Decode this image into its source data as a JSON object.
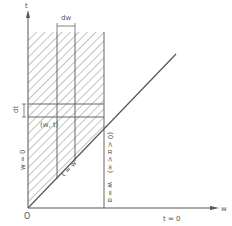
{
  "diagram": {
    "axes": {
      "horizontal_label": "w",
      "vertical_label": "t",
      "origin_label": "O"
    },
    "labels": {
      "dw": "dw",
      "dt": "dt",
      "point": "(w, t)",
      "w_zero": "w = 0",
      "t_zero": "t = 0",
      "t_eq_w": "t = w",
      "w_eq_alpha": "w = α",
      "alpha_range": "(0 < α < ∞)"
    },
    "colors": {
      "line": "#555555",
      "hatch": "#777777",
      "background": "#ffffff"
    }
  }
}
